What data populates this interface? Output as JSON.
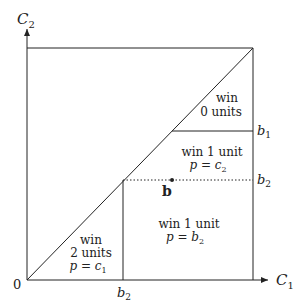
{
  "diagram": {
    "axes": {
      "x_label": "C",
      "x_sub": "1",
      "y_label": "C",
      "y_sub": "2",
      "origin_label": "0"
    },
    "ticks": {
      "b1": {
        "var": "b",
        "sub": "1"
      },
      "b2_right": {
        "var": "b",
        "sub": "2"
      },
      "b2_bottom": {
        "var": "b",
        "sub": "2"
      }
    },
    "point": {
      "label": "b"
    },
    "regions": [
      {
        "line1": "win",
        "line2": "0 units",
        "line3": ""
      },
      {
        "line1": "win 1 unit",
        "line2": "p = c",
        "sub": "2"
      },
      {
        "line1": "win 1 unit",
        "line2": "p = b",
        "sub": "2"
      },
      {
        "line1": "win",
        "line2": "2 units",
        "line3": "p = c",
        "sub": "1"
      }
    ],
    "colors": {
      "line": "#222222",
      "background": "#ffffff"
    }
  }
}
